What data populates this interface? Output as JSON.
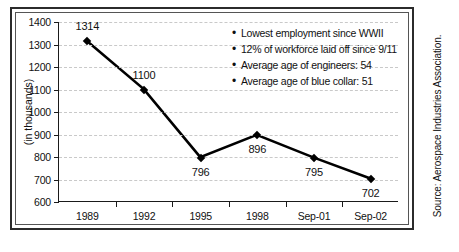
{
  "chart_data": {
    "type": "line",
    "title": "",
    "xlabel": "",
    "ylabel": "(in thousands)",
    "categories": [
      "1989",
      "1992",
      "1995",
      "1998",
      "Sep-01",
      "Sep-02"
    ],
    "values": [
      1314,
      1100,
      796,
      896,
      795,
      702
    ],
    "point_labels": [
      "1314",
      "1100",
      "796",
      "896",
      "795",
      "702"
    ],
    "label_positions": [
      "above",
      "above",
      "below",
      "below",
      "below",
      "below"
    ],
    "ylim": [
      600,
      1400
    ],
    "yticks": [
      600,
      700,
      800,
      900,
      1000,
      1100,
      1200,
      1300,
      1400
    ],
    "ytick_labels": [
      "600",
      "700",
      "800",
      "900",
      "1000",
      "1100",
      "1200",
      "1300",
      "1400"
    ],
    "grid": true,
    "grid_style": "dashed-light-gray",
    "legend": "none",
    "series_color": "#000000",
    "marker": "diamond",
    "annotations": [
      "Lowest employment since WWII",
      "12% of workforce laid off since 9/11",
      "Average age of engineers: 54",
      "Average age of blue collar: 51"
    ],
    "source": "Source: Aerospace Industries Association."
  },
  "notes": {
    "bullet_glyph": "•",
    "items": [
      "Lowest employment since WWII",
      "12% of workforce laid off since 9/11",
      "Average age of engineers: 54",
      "Average age of blue collar: 51"
    ]
  },
  "source_note": "Source: Aerospace Industries Association.",
  "colors": {
    "line": "#000000",
    "grid": "#c9c9c9",
    "axis": "#1a1a1a",
    "frame": "#2b2b2b",
    "text": "#111111",
    "background": "#ffffff"
  }
}
